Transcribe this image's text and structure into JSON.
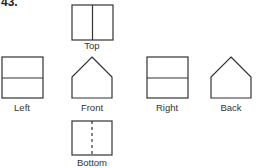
{
  "problem_number": "43.",
  "colors": {
    "stroke": "#333333",
    "text": "#333333",
    "background": "#ffffff"
  },
  "views": [
    {
      "name": "Top",
      "shape": "rectangle",
      "divider": "vertical-solid"
    },
    {
      "name": "Left",
      "shape": "rectangle",
      "divider": "horizontal-solid"
    },
    {
      "name": "Front",
      "shape": "pentagon",
      "divider": "none"
    },
    {
      "name": "Right",
      "shape": "rectangle",
      "divider": "horizontal-solid"
    },
    {
      "name": "Back",
      "shape": "pentagon",
      "divider": "none"
    },
    {
      "name": "Bottom",
      "shape": "rectangle",
      "divider": "vertical-dashed"
    }
  ],
  "labels": {
    "top": "Top",
    "left": "Left",
    "front": "Front",
    "right": "Right",
    "back": "Back",
    "bottom": "Bottom"
  }
}
